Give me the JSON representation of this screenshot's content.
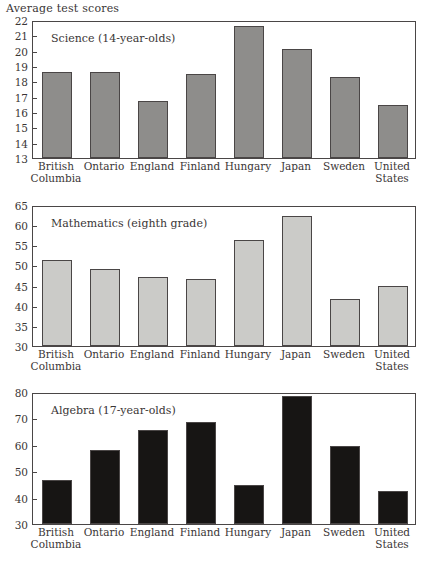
{
  "figure": {
    "axis_caption": "Average test scores",
    "categories": [
      "British Columbia",
      "Ontario",
      "England",
      "Finland",
      "Hungary",
      "Japan",
      "Sweden",
      "United States"
    ],
    "category_lines": [
      [
        "British",
        "Columbia"
      ],
      [
        "Ontario",
        ""
      ],
      [
        "England",
        ""
      ],
      [
        "Finland",
        ""
      ],
      [
        "Hungary",
        ""
      ],
      [
        "Japan",
        ""
      ],
      [
        "Sweden",
        ""
      ],
      [
        "United",
        "States"
      ]
    ]
  },
  "chart_data": [
    {
      "type": "bar",
      "title": "Science (14-year-olds)",
      "xlabel": "",
      "ylabel": "Average test scores",
      "categories": [
        "British Columbia",
        "Ontario",
        "England",
        "Finland",
        "Hungary",
        "Japan",
        "Sweden",
        "United States"
      ],
      "values": [
        18.6,
        18.6,
        16.7,
        18.45,
        21.6,
        20.1,
        18.3,
        16.45
      ],
      "ylim": [
        13,
        22
      ],
      "yticks": [
        13,
        14,
        15,
        16,
        17,
        18,
        19,
        20,
        21,
        22
      ],
      "bar_color": "#8e8d8b",
      "grid": false,
      "legend": "none"
    },
    {
      "type": "bar",
      "title": "Mathematics (eighth grade)",
      "xlabel": "",
      "ylabel": "Average test scores",
      "categories": [
        "British Columbia",
        "Ontario",
        "England",
        "Finland",
        "Hungary",
        "Japan",
        "Sweden",
        "United States"
      ],
      "values": [
        51.4,
        49.0,
        47.2,
        46.6,
        56.2,
        62.2,
        41.6,
        45.0
      ],
      "ylim": [
        30,
        65
      ],
      "yticks": [
        30,
        35,
        40,
        45,
        50,
        55,
        60,
        65
      ],
      "bar_color": "#cbcbc8",
      "grid": false,
      "legend": "none"
    },
    {
      "type": "bar",
      "title": "Algebra (17-year-olds)",
      "xlabel": "",
      "ylabel": "Average test scores",
      "categories": [
        "British Columbia",
        "Ontario",
        "England",
        "Finland",
        "Hungary",
        "Japan",
        "Sweden",
        "United States"
      ],
      "values": [
        46.8,
        58.2,
        65.6,
        68.5,
        44.6,
        78.4,
        59.6,
        42.6
      ],
      "ylim": [
        30,
        80
      ],
      "yticks": [
        30,
        40,
        50,
        60,
        70,
        80
      ],
      "bar_color": "#171514",
      "grid": false,
      "legend": "none"
    }
  ]
}
